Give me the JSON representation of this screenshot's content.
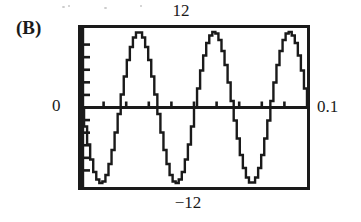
{
  "figure": {
    "panel_label": "(B)",
    "device": "graphing-calculator-screen"
  },
  "axis_labels": {
    "y_max": "12",
    "y_min": "−12",
    "y_zero": "0",
    "x_max": "0.1"
  },
  "chart_data": {
    "type": "line",
    "title": "(B)",
    "xlabel": "",
    "ylabel": "",
    "xlim": [
      0,
      0.1
    ],
    "ylim": [
      -12,
      12
    ],
    "grid": false,
    "legend": null,
    "x_tick_interval": 0.01,
    "y_tick_interval": 2,
    "x_tick_count": 10,
    "y_tick_count": 12,
    "tick_labels_shown": [
      "12",
      "-12",
      "0",
      "0.1"
    ],
    "rendering": "stepped-pixelated",
    "series": [
      {
        "name": "v(t)",
        "equation": "y = -12 sin(60 π t)",
        "amplitude": 12,
        "cycles_shown": 3,
        "period": 0.0333,
        "frequency_hz": 30,
        "phase": "starts at 0 descending",
        "x": [
          0,
          0.0042,
          0.0083,
          0.0125,
          0.0167,
          0.0208,
          0.025,
          0.0292,
          0.0333,
          0.0375,
          0.0417,
          0.0458,
          0.05,
          0.0542,
          0.0583,
          0.0625,
          0.0667,
          0.0708,
          0.075,
          0.0792,
          0.0833,
          0.0875,
          0.0917,
          0.0958,
          0.1
        ],
        "values": [
          0,
          -8.49,
          -12,
          -8.49,
          0,
          8.49,
          12,
          8.49,
          0,
          -8.49,
          -12,
          -8.49,
          0,
          8.49,
          12,
          8.49,
          0,
          -8.49,
          -12,
          -8.49,
          0,
          8.49,
          12,
          8.49,
          0
        ]
      }
    ]
  },
  "colors": {
    "ink": "#1a1a1a",
    "background": "#ffffff",
    "speckle": "#c9c9c9"
  }
}
